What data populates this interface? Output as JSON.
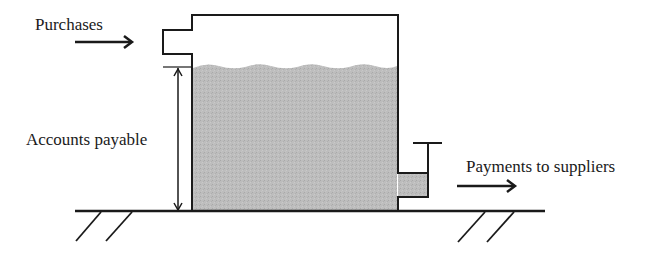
{
  "diagram": {
    "type": "tank-flow-analogy",
    "labels": {
      "inflow": "Purchases",
      "stock": "Accounts payable",
      "outflow": "Payments to suppliers"
    },
    "colors": {
      "fill": "#b8b8b8",
      "stroke": "#1a1a1a",
      "background": "#ffffff"
    }
  }
}
